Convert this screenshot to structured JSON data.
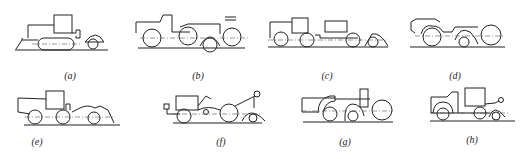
{
  "figure": {
    "panels": [
      {
        "id": "a",
        "label": "(a)",
        "description": "tracked vehicle with front blade, cab and rear wheel"
      },
      {
        "id": "b",
        "label": "(b)",
        "description": "truck tractor with semi-trailer and wheeled unit"
      },
      {
        "id": "c",
        "label": "(c)",
        "description": "tractor with flat trailer and rear wheeled unit"
      },
      {
        "id": "d",
        "label": "(d)",
        "description": "articulated wheeled machine with fenders"
      },
      {
        "id": "e",
        "label": "(e)",
        "description": "wheeled loader-type machine with rear drum"
      },
      {
        "id": "f",
        "label": "(f)",
        "description": "tractor with trailer and crane-type rear unit"
      },
      {
        "id": "g",
        "label": "(g)",
        "description": "wheeled machine with cab and large rear wheel"
      },
      {
        "id": "h",
        "label": "(h)",
        "description": "truck with box body and towed wheel"
      }
    ]
  }
}
